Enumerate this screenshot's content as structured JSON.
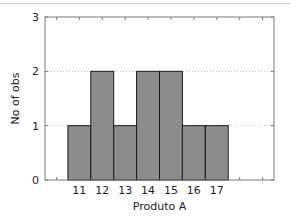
{
  "chart_data": {
    "type": "bar",
    "subtype": "histogram",
    "title": "",
    "xlabel": "Produto A",
    "ylabel": "No of obs",
    "categories": [
      "11",
      "12",
      "13",
      "14",
      "15",
      "16",
      "17"
    ],
    "values": [
      1,
      2,
      1,
      2,
      2,
      1,
      1
    ],
    "x_range": [
      9.5,
      19.5
    ],
    "ylim": [
      0,
      3
    ],
    "yticks": [
      "0",
      "1",
      "2",
      "3"
    ],
    "grid": "horizontal-dotted",
    "legend": "none",
    "colors": {
      "bar_fill": "#8c8c8c",
      "bar_edge": "#1a1a1a",
      "axis": "#7a7a7a",
      "grid": "#c0c0c0"
    }
  }
}
